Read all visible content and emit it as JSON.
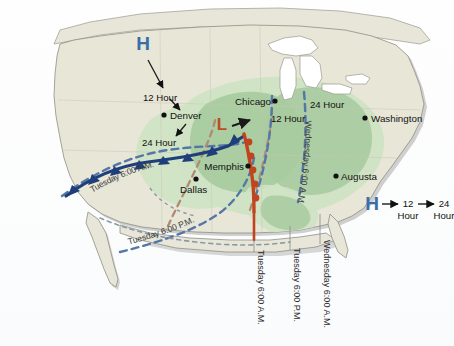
{
  "figure": {
    "type": "weather-forecast-map",
    "background_color": "#fdfdfd",
    "land_color": "#e8e6d8",
    "water_color": "#ffffff",
    "shadow_color": "#a9a9a9",
    "green_dark": "#a8cba0",
    "green_light": "#cfe3c4",
    "cold_front_color": "#1f3f7a",
    "warm_front_color": "#c1441e",
    "high_symbol_color": "#3a6ea8",
    "low_symbol_color": "#c14a20",
    "dashed_cold_color": "#5577a8",
    "dashed_warm_color": "#b08a72",
    "dashed_gray_color": "#8a9aa5"
  },
  "pressure_symbols": {
    "high": "H",
    "low": "L"
  },
  "west_track": {
    "symbol": "H",
    "steps": [
      {
        "label": "12 Hour"
      },
      {
        "label": "Denver",
        "kind": "city"
      },
      {
        "label": "24 Hour"
      }
    ]
  },
  "east_track": {
    "steps": [
      {
        "label": "12 Hour"
      },
      {
        "label": "24 Hour"
      }
    ]
  },
  "cities": [
    {
      "name": "Denver"
    },
    {
      "name": "Chicago"
    },
    {
      "name": "Dallas"
    },
    {
      "name": "Memphis"
    },
    {
      "name": "Washington"
    },
    {
      "name": "Augusta"
    }
  ],
  "hour_labels": {
    "west_12": "12 Hour",
    "west_24": "24 Hour",
    "east_12": "12 Hour",
    "east_24": "24 Hour"
  },
  "front_labels": {
    "tuesday_am_curved": "Tuesday 6:00 A.M.",
    "tuesday_pm_curved": "Tuesday 6:00 P.M.",
    "wednesday_am_curved": "Wednesday 6:00 A.M."
  },
  "vertical_labels": {
    "first": "Tuesday 6:00 A.M.",
    "second": "Tuesday 6:00 P.M.",
    "third": "Wednesday 6:00 A.M."
  },
  "legend": {
    "symbol": "H",
    "first_line1": "12",
    "first_line2": "Hour",
    "second_line1": "24",
    "second_line2": "Hour"
  }
}
